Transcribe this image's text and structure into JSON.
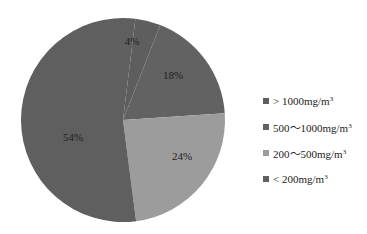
{
  "chart_data": {
    "type": "pie",
    "title": "",
    "categories": [
      ">1000mg/m3",
      "500~1000mg/m3",
      "200~500mg/m3",
      "<200mg/m3"
    ],
    "values": [
      4,
      18,
      24,
      54
    ],
    "labels": [
      "4%",
      "18%",
      "24%",
      "54%"
    ],
    "colors": [
      "#5e5e5e",
      "#626262",
      "#9c9c9c",
      "#5f5f5f"
    ],
    "legend_position": "right",
    "start_angle_deg": 0,
    "direction": "clockwise"
  },
  "legend": {
    "items": [
      {
        "prefix": "> 1000mg/m",
        "sup": "3",
        "color": "#5e5e5e"
      },
      {
        "prefix": "500～1000mg/m",
        "sup": "3",
        "color": "#626262"
      },
      {
        "prefix": "200～500mg/m",
        "sup": "3",
        "color": "#9c9c9c"
      },
      {
        "prefix": "< 200mg/m",
        "sup": "3",
        "color": "#5f5f5f"
      }
    ]
  },
  "slice_labels": [
    {
      "text": "4%",
      "x": 132,
      "y": 41
    },
    {
      "text": "18%",
      "x": 173,
      "y": 75
    },
    {
      "text": "24%",
      "x": 182,
      "y": 156
    },
    {
      "text": "54%",
      "x": 73,
      "y": 137
    }
  ]
}
